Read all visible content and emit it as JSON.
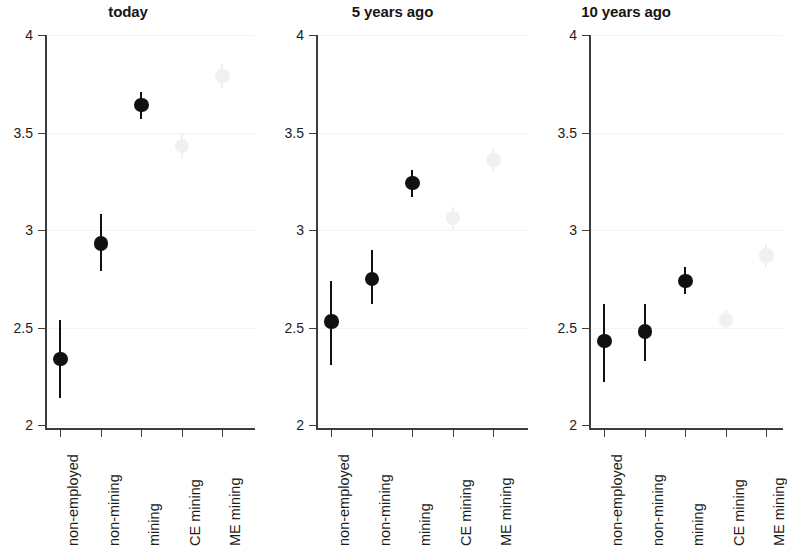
{
  "figure": {
    "width": 783,
    "height": 551,
    "background": "#ffffff",
    "point_color": "#111111",
    "faded_point_color": "#f0f0f0",
    "gridline_color": "#f4f4f4",
    "axis_color": "#3c3c3c"
  },
  "chart_data": {
    "type": "scatter",
    "title": "",
    "xlabel": "",
    "ylabel": "",
    "ylim": [
      2,
      4
    ],
    "yticks": [
      2,
      2.5,
      3,
      3.5,
      4
    ],
    "ytick_labels": [
      "2",
      "2.5",
      "3",
      "3.5",
      "4"
    ],
    "grid": true,
    "grid_axis": "y",
    "legend": "none",
    "categories": [
      "non-employed",
      "non-mining",
      "mining",
      "CE mining",
      "ME mining"
    ],
    "panels": [
      {
        "title": "today",
        "points": [
          {
            "category": "non-employed",
            "value": 2.34,
            "ci_low": 2.14,
            "ci_high": 2.54,
            "faded": false
          },
          {
            "category": "non-mining",
            "value": 2.93,
            "ci_low": 2.79,
            "ci_high": 3.08,
            "faded": false
          },
          {
            "category": "mining",
            "value": 3.64,
            "ci_low": 3.57,
            "ci_high": 3.71,
            "faded": false
          },
          {
            "category": "CE mining",
            "value": 3.43,
            "ci_low": 3.37,
            "ci_high": 3.49,
            "faded": true
          },
          {
            "category": "ME mining",
            "value": 3.79,
            "ci_low": 3.73,
            "ci_high": 3.85,
            "faded": true
          }
        ]
      },
      {
        "title": "5 years ago",
        "points": [
          {
            "category": "non-employed",
            "value": 2.53,
            "ci_low": 2.31,
            "ci_high": 2.74,
            "faded": false
          },
          {
            "category": "non-mining",
            "value": 2.75,
            "ci_low": 2.62,
            "ci_high": 2.9,
            "faded": false
          },
          {
            "category": "mining",
            "value": 3.24,
            "ci_low": 3.17,
            "ci_high": 3.31,
            "faded": false
          },
          {
            "category": "CE mining",
            "value": 3.06,
            "ci_low": 3.0,
            "ci_high": 3.12,
            "faded": true
          },
          {
            "category": "ME mining",
            "value": 3.36,
            "ci_low": 3.3,
            "ci_high": 3.42,
            "faded": true
          }
        ]
      },
      {
        "title": "10 years ago",
        "points": [
          {
            "category": "non-employed",
            "value": 2.43,
            "ci_low": 2.22,
            "ci_high": 2.62,
            "faded": false
          },
          {
            "category": "non-mining",
            "value": 2.48,
            "ci_low": 2.33,
            "ci_high": 2.62,
            "faded": false
          },
          {
            "category": "mining",
            "value": 2.74,
            "ci_low": 2.67,
            "ci_high": 2.81,
            "faded": false
          },
          {
            "category": "CE mining",
            "value": 2.54,
            "ci_low": 2.49,
            "ci_high": 2.59,
            "faded": true
          },
          {
            "category": "ME mining",
            "value": 2.87,
            "ci_low": 2.81,
            "ci_high": 2.93,
            "faded": true
          }
        ]
      }
    ]
  }
}
